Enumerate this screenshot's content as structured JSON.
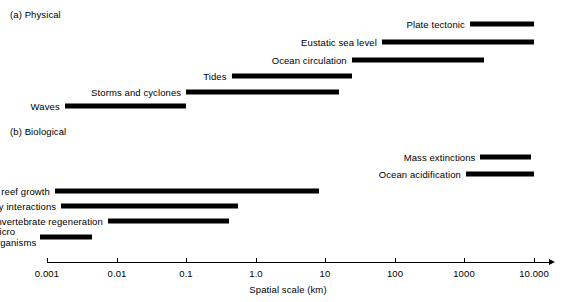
{
  "figure": {
    "panel_a_label": "(a) Physical",
    "panel_b_label": "(b) Biological",
    "axis_title": "Spatial scale (km)"
  },
  "chart_data": {
    "type": "bar",
    "orientation": "horizontal-ranges",
    "title": "",
    "xlabel": "Spatial scale (km)",
    "ylabel": "",
    "xscale": "log",
    "xlim": [
      0.001,
      10000
    ],
    "grid": false,
    "legend": false,
    "tick_labels": [
      "0.001",
      "0.01",
      "0.1",
      "1.0",
      "10",
      "100",
      "1000",
      "10.000"
    ],
    "tick_values": [
      0.001,
      0.01,
      0.1,
      1.0,
      10,
      100,
      1000,
      10000
    ],
    "panels": [
      {
        "name": "(a) Physical",
        "items": [
          {
            "label": "Plate tectonic",
            "start": 1200,
            "end": 10000
          },
          {
            "label": "Eustatic sea level",
            "start": 65,
            "end": 10000
          },
          {
            "label": "Ocean circulation",
            "start": 24,
            "end": 1900
          },
          {
            "label": "Tides",
            "start": 0.45,
            "end": 24
          },
          {
            "label": "Storms and cyclones",
            "start": 0.1,
            "end": 16
          },
          {
            "label": "Waves",
            "start": 0.0018,
            "end": 0.1
          }
        ]
      },
      {
        "name": "(b) Biological",
        "items": [
          {
            "label": "Mass extinctions",
            "start": 1700,
            "end": 9000
          },
          {
            "label": "Ocean acidification",
            "start": 1050,
            "end": 10000
          },
          {
            "label": "Coral reef growth",
            "start": 0.0013,
            "end": 8.0
          },
          {
            "label": "Community interactions",
            "start": 0.0016,
            "end": 0.55
          },
          {
            "label": "Invertebrate regeneration",
            "start": 0.0075,
            "end": 0.42
          },
          {
            "label": "Micro\norganisms",
            "start": 0.0008,
            "end": 0.0045
          }
        ]
      }
    ]
  },
  "colors": {
    "bar": "#000000",
    "axis": "#000000",
    "background": "#ffffff"
  }
}
